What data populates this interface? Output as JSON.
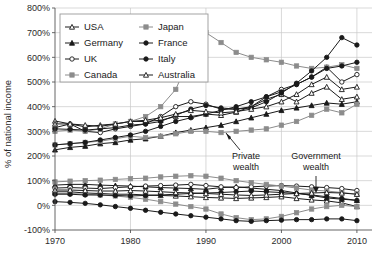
{
  "chart_data": {
    "type": "line",
    "title": "",
    "xlabel": "",
    "ylabel": "% of national income",
    "xlim": [
      1970,
      2012
    ],
    "ylim": [
      -100,
      800
    ],
    "ytick_labels": [
      "800%",
      "700%",
      "600%",
      "500%",
      "400%",
      "300%",
      "200%",
      "100%",
      "0%",
      "-100%"
    ],
    "yticks": [
      800,
      700,
      600,
      500,
      400,
      300,
      200,
      100,
      0,
      -100
    ],
    "xtick_labels": [
      "1970",
      "1980",
      "1990",
      "2000",
      "2010"
    ],
    "xticks": [
      1970,
      1980,
      1990,
      2000,
      2010
    ],
    "grid": true,
    "legend_position": "top-left",
    "annotations": [
      {
        "text": "Private wealth",
        "x": 2000,
        "y": 175
      },
      {
        "text": "Government wealth",
        "x": 2003,
        "y": 175
      }
    ],
    "series": [
      {
        "name": "USA",
        "group": "private",
        "marker": "open-triangle",
        "color": "#1a1a1a",
        "fill": "#ffffff",
        "x": [
          1970,
          1972,
          1974,
          1976,
          1978,
          1980,
          1982,
          1984,
          1986,
          1988,
          1990,
          1992,
          1994,
          1996,
          1998,
          2000,
          2002,
          2004,
          2006,
          2008,
          2010
        ],
        "values": [
          342,
          330,
          318,
          325,
          330,
          340,
          340,
          345,
          360,
          360,
          370,
          365,
          378,
          400,
          430,
          450,
          420,
          455,
          480,
          430,
          440
        ]
      },
      {
        "name": "Germany",
        "group": "private",
        "marker": "filled-triangle",
        "color": "#1a1a1a",
        "fill": "#1a1a1a",
        "x": [
          1970,
          1972,
          1974,
          1976,
          1978,
          1980,
          1982,
          1984,
          1986,
          1988,
          1990,
          1992,
          1994,
          1996,
          1998,
          2000,
          2002,
          2004,
          2006,
          2008,
          2010
        ],
        "values": [
          225,
          235,
          240,
          250,
          255,
          265,
          270,
          280,
          295,
          305,
          315,
          325,
          340,
          355,
          370,
          385,
          395,
          405,
          415,
          410,
          420
        ]
      },
      {
        "name": "UK",
        "group": "private",
        "marker": "open-circle",
        "color": "#1a1a1a",
        "fill": "#ffffff",
        "x": [
          1970,
          1972,
          1974,
          1976,
          1978,
          1980,
          1982,
          1984,
          1986,
          1988,
          1990,
          1992,
          1994,
          1996,
          1998,
          2000,
          2002,
          2004,
          2006,
          2008,
          2010
        ],
        "values": [
          315,
          330,
          300,
          295,
          310,
          320,
          330,
          360,
          400,
          420,
          410,
          390,
          390,
          400,
          440,
          470,
          490,
          520,
          560,
          500,
          530
        ]
      },
      {
        "name": "Canada",
        "group": "private",
        "marker": "filled-square-gray",
        "color": "#8c8c8c",
        "fill": "#8c8c8c",
        "x": [
          1970,
          1972,
          1974,
          1976,
          1978,
          1980,
          1982,
          1984,
          1986,
          1988,
          1990,
          1992,
          1994,
          1996,
          1998,
          2000,
          2002,
          2004,
          2006,
          2008,
          2010
        ],
        "values": [
          245,
          250,
          255,
          260,
          270,
          280,
          275,
          280,
          290,
          300,
          300,
          295,
          300,
          305,
          310,
          325,
          340,
          365,
          390,
          375,
          410
        ]
      },
      {
        "name": "Japan",
        "group": "private",
        "marker": "filled-square-gray",
        "color": "#8c8c8c",
        "fill": "#8c8c8c",
        "x": [
          1970,
          1972,
          1974,
          1976,
          1978,
          1980,
          1982,
          1984,
          1986,
          1988,
          1990,
          1992,
          1994,
          1996,
          1998,
          2000,
          2002,
          2004,
          2006,
          2008,
          2010
        ],
        "values": [
          300,
          305,
          300,
          310,
          330,
          340,
          360,
          400,
          470,
          610,
          700,
          660,
          620,
          600,
          590,
          580,
          565,
          555,
          560,
          570,
          555
        ]
      },
      {
        "name": "France",
        "group": "private",
        "marker": "filled-circle",
        "color": "#1a1a1a",
        "fill": "#1a1a1a",
        "x": [
          1970,
          1972,
          1974,
          1976,
          1978,
          1980,
          1982,
          1984,
          1986,
          1988,
          1990,
          1992,
          1994,
          1996,
          1998,
          2000,
          2002,
          2004,
          2006,
          2008,
          2010
        ],
        "values": [
          310,
          308,
          305,
          310,
          315,
          325,
          330,
          340,
          365,
          390,
          405,
          395,
          390,
          395,
          420,
          455,
          495,
          545,
          600,
          680,
          650
        ]
      },
      {
        "name": "Italy",
        "group": "private",
        "marker": "filled-circle",
        "color": "#1a1a1a",
        "fill": "#1a1a1a",
        "x": [
          1970,
          1972,
          1974,
          1976,
          1978,
          1980,
          1982,
          1984,
          1986,
          1988,
          1990,
          1992,
          1994,
          1996,
          1998,
          2000,
          2002,
          2004,
          2006,
          2008,
          2010
        ],
        "values": [
          245,
          250,
          255,
          265,
          275,
          285,
          300,
          320,
          340,
          355,
          370,
          385,
          400,
          420,
          440,
          460,
          490,
          520,
          555,
          565,
          580
        ]
      },
      {
        "name": "Australia",
        "group": "private",
        "marker": "open-triangle",
        "color": "#1a1a1a",
        "fill": "#ffffff",
        "x": [
          1970,
          1972,
          1974,
          1976,
          1978,
          1980,
          1982,
          1984,
          1986,
          1988,
          1990,
          1992,
          1994,
          1996,
          1998,
          2000,
          2002,
          2004,
          2006,
          2008,
          2010
        ],
        "values": [
          330,
          330,
          325,
          320,
          330,
          340,
          345,
          355,
          370,
          385,
          380,
          375,
          380,
          390,
          400,
          420,
          450,
          490,
          520,
          470,
          480
        ]
      },
      {
        "name": "USA",
        "group": "government",
        "marker": "open-triangle",
        "color": "#1a1a1a",
        "fill": "#ffffff",
        "x": [
          1970,
          1972,
          1974,
          1976,
          1978,
          1980,
          1982,
          1984,
          1986,
          1988,
          1990,
          1992,
          1994,
          1996,
          1998,
          2000,
          2002,
          2004,
          2006,
          2008,
          2010
        ],
        "values": [
          55,
          55,
          50,
          48,
          45,
          45,
          42,
          40,
          38,
          35,
          32,
          30,
          28,
          30,
          32,
          35,
          28,
          22,
          18,
          10,
          -5
        ]
      },
      {
        "name": "Germany",
        "group": "government",
        "marker": "filled-triangle",
        "color": "#1a1a1a",
        "fill": "#1a1a1a",
        "x": [
          1970,
          1972,
          1974,
          1976,
          1978,
          1980,
          1982,
          1984,
          1986,
          1988,
          1990,
          1992,
          1994,
          1996,
          1998,
          2000,
          2002,
          2004,
          2006,
          2008,
          2010
        ],
        "values": [
          82,
          85,
          85,
          82,
          80,
          78,
          75,
          72,
          70,
          68,
          65,
          72,
          75,
          70,
          65,
          60,
          50,
          40,
          30,
          25,
          20
        ]
      },
      {
        "name": "UK",
        "group": "government",
        "marker": "open-circle",
        "color": "#1a1a1a",
        "fill": "#ffffff",
        "x": [
          1970,
          1972,
          1974,
          1976,
          1978,
          1980,
          1982,
          1984,
          1986,
          1988,
          1990,
          1992,
          1994,
          1996,
          1998,
          2000,
          2002,
          2004,
          2006,
          2008,
          2010
        ],
        "values": [
          70,
          72,
          70,
          68,
          72,
          75,
          78,
          80,
          82,
          85,
          80,
          75,
          72,
          75,
          78,
          80,
          78,
          75,
          72,
          68,
          60
        ]
      },
      {
        "name": "Canada",
        "group": "government",
        "marker": "filled-square-gray",
        "color": "#8c8c8c",
        "fill": "#8c8c8c",
        "x": [
          1970,
          1972,
          1974,
          1976,
          1978,
          1980,
          1982,
          1984,
          1986,
          1988,
          1990,
          1992,
          1994,
          1996,
          1998,
          2000,
          2002,
          2004,
          2006,
          2008,
          2010
        ],
        "values": [
          48,
          48,
          45,
          42,
          38,
          32,
          25,
          15,
          5,
          -5,
          -15,
          -35,
          -50,
          -58,
          -55,
          -45,
          -30,
          -15,
          -5,
          0,
          -5
        ]
      },
      {
        "name": "Japan",
        "group": "government",
        "marker": "filled-square-gray",
        "color": "#8c8c8c",
        "fill": "#8c8c8c",
        "x": [
          1970,
          1972,
          1974,
          1976,
          1978,
          1980,
          1982,
          1984,
          1986,
          1988,
          1990,
          1992,
          1994,
          1996,
          1998,
          2000,
          2002,
          2004,
          2006,
          2008,
          2010
        ],
        "values": [
          95,
          98,
          100,
          102,
          105,
          108,
          110,
          115,
          118,
          120,
          118,
          110,
          100,
          92,
          85,
          78,
          70,
          62,
          58,
          52,
          45
        ]
      },
      {
        "name": "France",
        "group": "government",
        "marker": "filled-circle",
        "color": "#1a1a1a",
        "fill": "#1a1a1a",
        "x": [
          1970,
          1972,
          1974,
          1976,
          1978,
          1980,
          1982,
          1984,
          1986,
          1988,
          1990,
          1992,
          1994,
          1996,
          1998,
          2000,
          2002,
          2004,
          2006,
          2008,
          2010
        ],
        "values": [
          45,
          45,
          42,
          42,
          40,
          38,
          40,
          42,
          45,
          48,
          50,
          52,
          55,
          58,
          55,
          52,
          48,
          42,
          35,
          28,
          20
        ]
      },
      {
        "name": "Italy",
        "group": "government",
        "marker": "filled-circle",
        "color": "#1a1a1a",
        "fill": "#1a1a1a",
        "x": [
          1970,
          1972,
          1974,
          1976,
          1978,
          1980,
          1982,
          1984,
          1986,
          1988,
          1990,
          1992,
          1994,
          1996,
          1998,
          2000,
          2002,
          2004,
          2006,
          2008,
          2010
        ],
        "values": [
          15,
          12,
          8,
          2,
          -5,
          -12,
          -20,
          -28,
          -35,
          -42,
          -48,
          -55,
          -62,
          -65,
          -62,
          -60,
          -58,
          -58,
          -55,
          -55,
          -62
        ]
      },
      {
        "name": "Australia",
        "group": "government",
        "marker": "open-triangle",
        "color": "#1a1a1a",
        "fill": "#ffffff",
        "x": [
          1970,
          1972,
          1974,
          1976,
          1978,
          1980,
          1982,
          1984,
          1986,
          1988,
          1990,
          1992,
          1994,
          1996,
          1998,
          2000,
          2002,
          2004,
          2006,
          2008,
          2010
        ],
        "values": [
          62,
          62,
          60,
          58,
          58,
          60,
          58,
          55,
          52,
          50,
          48,
          45,
          42,
          40,
          42,
          45,
          48,
          50,
          52,
          50,
          45
        ]
      }
    ],
    "legend": [
      {
        "label": "USA",
        "marker": "open-triangle",
        "color": "#1a1a1a",
        "fill": "#ffffff"
      },
      {
        "label": "Japan",
        "marker": "filled-square-gray",
        "color": "#8c8c8c",
        "fill": "#8c8c8c"
      },
      {
        "label": "Germany",
        "marker": "filled-triangle",
        "color": "#1a1a1a",
        "fill": "#1a1a1a"
      },
      {
        "label": "France",
        "marker": "filled-circle",
        "color": "#1a1a1a",
        "fill": "#1a1a1a"
      },
      {
        "label": "UK",
        "marker": "open-circle",
        "color": "#1a1a1a",
        "fill": "#ffffff"
      },
      {
        "label": "Italy",
        "marker": "filled-circle",
        "color": "#1a1a1a",
        "fill": "#1a1a1a"
      },
      {
        "label": "Canada",
        "marker": "filled-square-gray",
        "color": "#8c8c8c",
        "fill": "#8c8c8c"
      },
      {
        "label": "Australia",
        "marker": "open-triangle",
        "color": "#1a1a1a",
        "fill": "#ffffff"
      }
    ]
  }
}
